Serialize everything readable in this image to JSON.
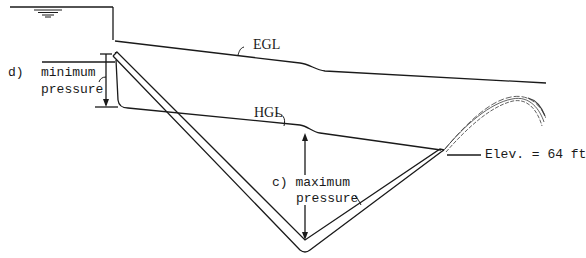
{
  "diagram": {
    "labels": {
      "egl": "EGL",
      "hgl": "HGL",
      "min_pressure_tag": "d)",
      "min_pressure_line1": "minimum",
      "min_pressure_line2": "pressure",
      "max_pressure_line1": "c) maximum",
      "max_pressure_line2": "pressure",
      "elevation": "Elev. = 64 ft"
    },
    "colors": {
      "line": "#1a1a1a",
      "background": "#ffffff"
    }
  }
}
